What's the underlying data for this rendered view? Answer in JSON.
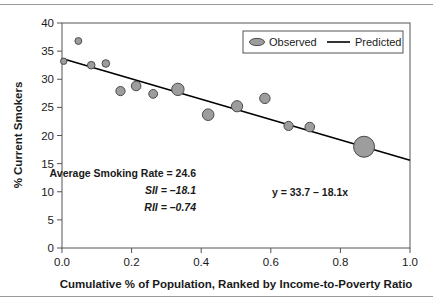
{
  "chart_data": {
    "type": "scatter",
    "title": "",
    "xlabel": "Cumulative % of Population, Ranked by Income-to-Poverty Ratio",
    "ylabel": "% Current Smokers",
    "xlim": [
      0.0,
      1.0
    ],
    "ylim": [
      0,
      40
    ],
    "xticks": [
      "0.0",
      "0.2",
      "0.4",
      "0.6",
      "0.8",
      "1.0"
    ],
    "xtick_values": [
      0.0,
      0.2,
      0.4,
      0.6,
      0.8,
      1.0
    ],
    "yticks": [
      "0",
      "5",
      "10",
      "15",
      "20",
      "25",
      "30",
      "35",
      "40"
    ],
    "ytick_values": [
      0,
      5,
      10,
      15,
      20,
      25,
      30,
      35,
      40
    ],
    "grid": false,
    "legend_position": "top-right",
    "series": [
      {
        "name": "Observed",
        "type": "scatter",
        "marker": "circle",
        "color": "#9d9d9d",
        "edge_color": "#4a4a4a",
        "points": [
          {
            "x": 0.005,
            "y": 33.2,
            "size": 3.2
          },
          {
            "x": 0.047,
            "y": 36.8,
            "size": 3.4
          },
          {
            "x": 0.084,
            "y": 32.5,
            "size": 3.8
          },
          {
            "x": 0.126,
            "y": 32.8,
            "size": 3.8
          },
          {
            "x": 0.168,
            "y": 27.9,
            "size": 4.6
          },
          {
            "x": 0.213,
            "y": 28.8,
            "size": 4.8
          },
          {
            "x": 0.262,
            "y": 27.4,
            "size": 4.4
          },
          {
            "x": 0.333,
            "y": 28.2,
            "size": 6.2
          },
          {
            "x": 0.42,
            "y": 23.7,
            "size": 5.8
          },
          {
            "x": 0.503,
            "y": 25.2,
            "size": 5.6
          },
          {
            "x": 0.583,
            "y": 26.6,
            "size": 5.2
          },
          {
            "x": 0.651,
            "y": 21.7,
            "size": 4.6
          },
          {
            "x": 0.712,
            "y": 21.5,
            "size": 4.8
          },
          {
            "x": 0.868,
            "y": 18.0,
            "size": 10.5
          }
        ]
      },
      {
        "name": "Predicted",
        "type": "line",
        "color": "#000000",
        "intercept": 33.7,
        "slope": -18.1,
        "endpoints": [
          {
            "x": 0.0,
            "y": 33.7
          },
          {
            "x": 1.0,
            "y": 15.6
          }
        ]
      }
    ],
    "annotations": [
      {
        "name": "average-smoking-rate",
        "text": "Average Smoking Rate =  24.6",
        "italic": false
      },
      {
        "name": "sii-value",
        "text": "SII = –18.1",
        "italic": true
      },
      {
        "name": "rii-value",
        "text": "RII = –0.74",
        "italic": true
      },
      {
        "name": "regression-equation",
        "text": "y = 33.7 – 18.1x",
        "italic": false
      }
    ]
  },
  "legend": {
    "observed_label": "Observed",
    "predicted_label": "Predicted"
  },
  "axes": {
    "x_title": "Cumulative % of Population, Ranked by Income-to-Poverty Ratio",
    "y_title": "% Current Smokers"
  },
  "annotations": {
    "average_smoking_rate": "Average Smoking Rate =  24.6",
    "sii": "SII = –18.1",
    "rii": "RII = –0.74",
    "equation": "y = 33.7 – 18.1x"
  },
  "colors": {
    "marker_fill": "#9d9d9d",
    "marker_edge": "#4a4a4a",
    "line": "#000000",
    "frame": "#555555",
    "rule": "#9a9a9a"
  }
}
